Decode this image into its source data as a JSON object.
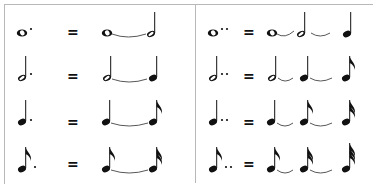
{
  "equals_symbol": "=",
  "colors": {
    "ink": "#111111",
    "border": "#b8b8b8",
    "tie": "#444444"
  },
  "left_table": {
    "heading": "single dot",
    "rows": [
      {
        "lhs": "dotted whole note",
        "rhs": [
          "whole note",
          "tie",
          "half note"
        ]
      },
      {
        "lhs": "dotted half note",
        "rhs": [
          "half note",
          "tie",
          "quarter note"
        ]
      },
      {
        "lhs": "dotted quarter note",
        "rhs": [
          "quarter note",
          "tie",
          "eighth note"
        ]
      },
      {
        "lhs": "dotted eighth note",
        "rhs": [
          "eighth note",
          "tie",
          "sixteenth note"
        ]
      }
    ]
  },
  "right_table": {
    "heading": "double dot",
    "rows": [
      {
        "lhs": "double-dotted whole note",
        "rhs": [
          "whole note",
          "tie",
          "half note",
          "tie",
          "quarter note"
        ]
      },
      {
        "lhs": "double-dotted half note",
        "rhs": [
          "half note",
          "tie",
          "quarter note",
          "tie",
          "eighth note"
        ]
      },
      {
        "lhs": "double-dotted quarter note",
        "rhs": [
          "quarter note",
          "tie",
          "eighth note",
          "tie",
          "sixteenth note"
        ]
      },
      {
        "lhs": "double-dotted eighth note",
        "rhs": [
          "eighth note",
          "tie",
          "sixteenth note",
          "tie",
          "thirty-second note"
        ]
      }
    ]
  }
}
